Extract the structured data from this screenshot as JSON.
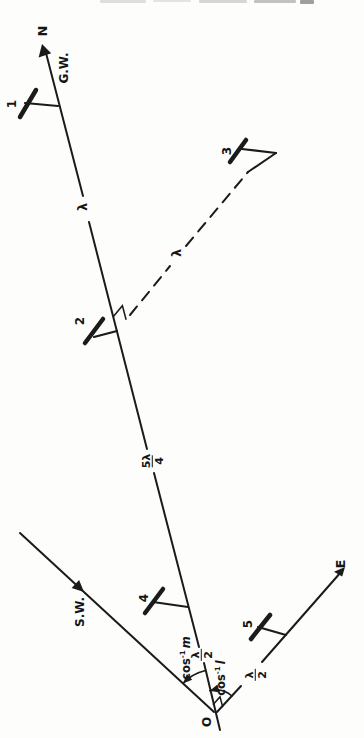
{
  "figure": {
    "ink_color": "#1b1b1b",
    "paper_color": "#fdfdfc"
  },
  "labels": {
    "north": "N",
    "gw": "G.W.",
    "sw": "S.W.",
    "east": "E",
    "origin": "O"
  },
  "stations": [
    {
      "id": "1"
    },
    {
      "id": "2"
    },
    {
      "id": "3"
    },
    {
      "id": "4"
    },
    {
      "id": "5"
    }
  ],
  "distances": {
    "seg_1_2": {
      "text": "λ"
    },
    "sightline": {
      "text": "λ"
    },
    "seg_2_4": {
      "numerator": "5λ",
      "denominator": "4"
    },
    "seg_4_origin": {
      "numerator": "λ",
      "denominator": "2"
    },
    "east_seg": {
      "numerator": "λ",
      "denominator": "2"
    }
  },
  "angles": {
    "angle_m": {
      "func": "cos",
      "exp": "-1",
      "variable": "m"
    },
    "angle_l": {
      "func": "cos",
      "exp": "-1",
      "variable": "l"
    }
  }
}
